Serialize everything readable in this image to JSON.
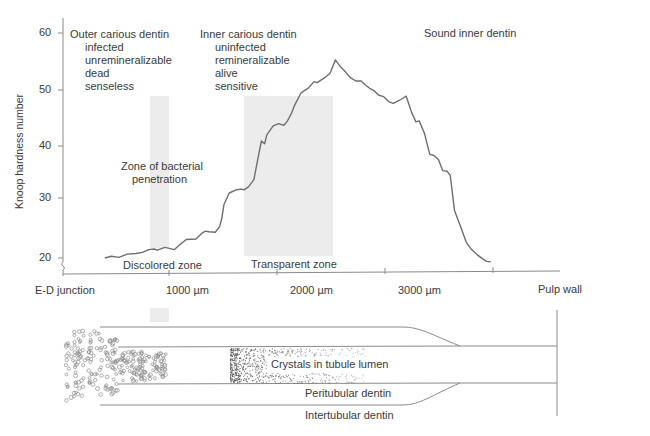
{
  "chart_data": {
    "type": "line",
    "title": "",
    "xlabel": "",
    "ylabel": "Knoop hardness number",
    "ylim": [
      18,
      62
    ],
    "yticks": [
      20,
      30,
      40,
      50,
      60
    ],
    "xlim": [
      0,
      4600
    ],
    "xticks": [
      {
        "value": 0,
        "label": "E-D junction"
      },
      {
        "value": 1000,
        "label": "1000 µm"
      },
      {
        "value": 2000,
        "label": "2000 µm"
      },
      {
        "value": 3000,
        "label": "3000 µm"
      },
      {
        "value": 4000,
        "label": "Pulp wall"
      }
    ],
    "grid": false,
    "series": [
      {
        "name": "Knoop hardness",
        "color": "#6e6e6e",
        "x": [
          390,
          450,
          520,
          600,
          680,
          740,
          800,
          850,
          880,
          950,
          1040,
          1090,
          1150,
          1240,
          1300,
          1330,
          1360,
          1420,
          1460,
          1480,
          1500,
          1550,
          1620,
          1660,
          1690,
          1730,
          1780,
          1820,
          1850,
          1880,
          1900,
          1960,
          2010,
          2060,
          2090,
          2130,
          2160,
          2220,
          2290,
          2340,
          2370,
          2440,
          2490,
          2540,
          2580,
          2640,
          2680,
          2730,
          2780,
          2820,
          2860,
          2900,
          2940,
          2990,
          3040,
          3080,
          3120,
          3150,
          3200,
          3250,
          3290,
          3320,
          3370,
          3420,
          3460,
          3500,
          3540,
          3580,
          3610,
          3650,
          3700,
          3760,
          3810,
          3860,
          3910,
          3950,
          3990
        ],
        "y": [
          20.0,
          20.3,
          20.1,
          20.7,
          20.8,
          21.0,
          21.5,
          21.6,
          21.4,
          21.9,
          21.5,
          22.4,
          23.3,
          23.4,
          24.5,
          24.8,
          24.7,
          24.6,
          25.6,
          27.0,
          29.5,
          31.6,
          32.2,
          32.3,
          32.2,
          32.7,
          34.0,
          38.0,
          40.9,
          40.4,
          42.0,
          43.6,
          44.0,
          43.7,
          44.4,
          45.8,
          47.3,
          49.5,
          50.4,
          51.5,
          51.3,
          52.2,
          53.0,
          55.4,
          54.3,
          53.1,
          52.2,
          51.6,
          51.6,
          50.9,
          50.3,
          49.9,
          49.1,
          48.8,
          47.9,
          47.6,
          48.0,
          48.3,
          48.9,
          46.0,
          44.3,
          44.5,
          42.3,
          38.5,
          38.3,
          37.6,
          35.6,
          35.5,
          34.8,
          28.5,
          26.0,
          22.8,
          21.5,
          20.6,
          19.9,
          19.4,
          19.3
        ]
      }
    ],
    "shaded_regions": [
      {
        "name": "Zone of bacterial penetration",
        "x0": 820,
        "x1": 1000,
        "y0": 21.6,
        "y1": 48.7,
        "color": "#ececec"
      },
      {
        "name": "Transparent zone",
        "x0": 1690,
        "x1": 2515,
        "y0": 20.3,
        "y1": 48.7,
        "color": "#ececec"
      }
    ],
    "annotations": [
      {
        "text": "Outer carious dentin",
        "sub": [
          "infected",
          "unremineralizable",
          "dead",
          "senseless"
        ]
      },
      {
        "text": "Inner carious dentin",
        "sub": [
          "uninfected",
          "remineralizable",
          "alive",
          "sensitive"
        ]
      },
      {
        "text": "Sound inner dentin",
        "sub": []
      },
      {
        "text": "Zone of bacterial penetration"
      },
      {
        "text": "Discolored zone"
      },
      {
        "text": "Transparent zone"
      }
    ]
  },
  "labels": {
    "ylabel": "Knoop hardness number",
    "outer": {
      "title": "Outer carious dentin",
      "lines": [
        "infected",
        "unremineralizable",
        "dead",
        "senseless"
      ]
    },
    "inner": {
      "title": "Inner carious dentin",
      "lines": [
        "uninfected",
        "remineralizable",
        "alive",
        "sensitive"
      ]
    },
    "sound": "Sound inner dentin",
    "bacterial_line1": "Zone of bacterial",
    "bacterial_line2": "penetration",
    "discolored": "Discolored zone",
    "transparent": "Transparent zone",
    "yticks": [
      "60",
      "50",
      "40",
      "30",
      "20"
    ],
    "xticks": [
      "E-D junction",
      "1000 µm",
      "2000 µm",
      "3000 µm",
      "Pulp wall"
    ]
  },
  "diagram": {
    "crystals": "Crystals in tubule lumen",
    "peritubular": "Peritubular dentin",
    "intertubular": "Intertubular dentin"
  },
  "colors": {
    "curve": "#6e6e6e",
    "axis": "#8a8a8a",
    "shade": "#ececec",
    "text": "#3a3a3a"
  }
}
